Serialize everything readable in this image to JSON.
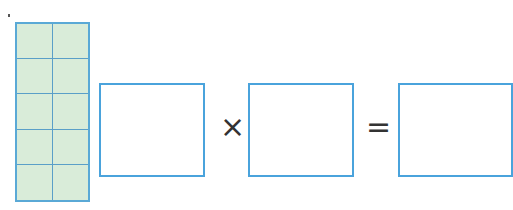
{
  "figure": {
    "grid": {
      "rows": 5,
      "cols": 2,
      "fill_color": "#d9ecd9",
      "line_color": "#5aa9d6"
    },
    "equation": {
      "operand1": "",
      "operator1": "×",
      "operand2": "",
      "operator2": "=",
      "result": ""
    },
    "box_color": "#4aa3dc"
  }
}
